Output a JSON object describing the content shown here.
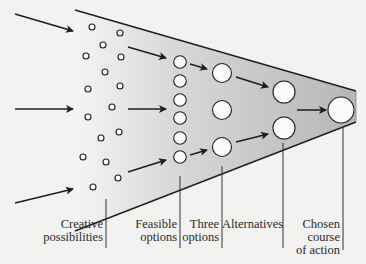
{
  "diagram": {
    "type": "funnel",
    "colors": {
      "background": "#f2f2f0",
      "funnel_fill_left": "#f4f4f2",
      "funnel_fill_right": "#b9b9b7",
      "stroke": "#1e1e1e",
      "circle_fill": "#fafafa"
    },
    "stages": [
      {
        "id": "creative",
        "label_lines": [
          "Creative",
          "possibilities"
        ]
      },
      {
        "id": "feasible",
        "label_lines": [
          "Feasible",
          "options"
        ]
      },
      {
        "id": "three",
        "label_lines": [
          "Three",
          "options"
        ]
      },
      {
        "id": "alternatives",
        "label_lines": [
          "Alternatives"
        ]
      },
      {
        "id": "chosen",
        "label_lines": [
          "Chosen",
          "course",
          "of action"
        ]
      }
    ]
  }
}
